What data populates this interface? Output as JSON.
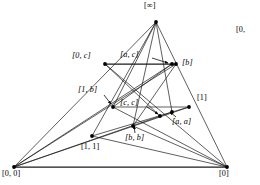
{
  "figure": {
    "type": "lattice-diagram",
    "background_color": "#ffffff",
    "line_color": "#1a1a1a",
    "vertex_color": "#000000",
    "nodes": [
      {
        "id": "infinity",
        "label": "[∞]",
        "x": 156,
        "y": 22,
        "label_x": 144,
        "label_y": 2,
        "leader": false
      },
      {
        "id": "zero_c",
        "label": "[0, c]",
        "x": 105,
        "y": 64,
        "label_x": 72,
        "label_y": 52,
        "leader": false
      },
      {
        "id": "a_c",
        "label": "[a, c]",
        "x": 172,
        "y": 64,
        "label_x": 120,
        "label_y": 51,
        "leader": true,
        "leader_x1": 152,
        "leader_y1": 58,
        "leader_x2": 168,
        "leader_y2": 63
      },
      {
        "id": "b",
        "label": "[b]",
        "x": 176,
        "y": 64,
        "label_x": 182,
        "label_y": 59,
        "leader": false
      },
      {
        "id": "one_b",
        "label": "[1, b]",
        "x": 113,
        "y": 107,
        "label_x": 78,
        "label_y": 86,
        "leader": true,
        "leader_x1": 104,
        "leader_y1": 95,
        "leader_x2": 111,
        "leader_y2": 104
      },
      {
        "id": "c_c",
        "label": "[c, c]",
        "x": 160,
        "y": 116,
        "label_x": 120,
        "label_y": 99,
        "leader": true,
        "leader_x1": 147,
        "leader_y1": 107,
        "leader_x2": 158,
        "leader_y2": 114
      },
      {
        "id": "one",
        "label": "[1]",
        "x": 189,
        "y": 107,
        "label_x": 197,
        "label_y": 94,
        "leader": false
      },
      {
        "id": "a_a",
        "label": "[a, a]",
        "x": 172,
        "y": 112,
        "label_x": 172,
        "label_y": 118,
        "leader": true,
        "leader_x1": 176,
        "leader_y1": 117,
        "leader_x2": 170,
        "leader_y2": 112
      },
      {
        "id": "b_b",
        "label": "[b, b]",
        "x": 133,
        "y": 126,
        "label_x": 125,
        "label_y": 134,
        "leader": true,
        "leader_x1": 135,
        "leader_y1": 133,
        "leader_x2": 134,
        "leader_y2": 126
      },
      {
        "id": "one_one",
        "label": "[1, 1]",
        "x": 92,
        "y": 136,
        "label_x": 81,
        "label_y": 143,
        "leader": false
      },
      {
        "id": "zero_zero",
        "label": "[0, 0]",
        "x": 14,
        "y": 167,
        "label_x": 2,
        "label_y": 170,
        "leader": false
      },
      {
        "id": "zero",
        "label": "[0]",
        "x": 227,
        "y": 167,
        "label_x": 219,
        "label_y": 170,
        "leader": false
      }
    ],
    "edges": [
      {
        "from": "zero_zero",
        "to": "infinity",
        "weight": "thin"
      },
      {
        "from": "zero_zero",
        "to": "zero",
        "weight": "thick"
      },
      {
        "from": "infinity",
        "to": "zero",
        "weight": "thin"
      },
      {
        "from": "zero_c",
        "to": "b",
        "weight": "thick"
      },
      {
        "from": "infinity",
        "to": "one_b",
        "weight": "thin"
      },
      {
        "from": "infinity",
        "to": "b_b",
        "weight": "thin"
      },
      {
        "from": "infinity",
        "to": "a_a",
        "weight": "thin"
      },
      {
        "from": "infinity",
        "to": "one_one",
        "weight": "thin"
      },
      {
        "from": "zero_zero",
        "to": "a_c",
        "weight": "thin"
      },
      {
        "from": "zero_zero",
        "to": "one",
        "weight": "thin"
      },
      {
        "from": "zero_zero",
        "to": "a_a",
        "weight": "thin"
      },
      {
        "from": "zero_zero",
        "to": "b",
        "weight": "thin"
      },
      {
        "from": "zero",
        "to": "zero_c",
        "weight": "thin"
      },
      {
        "from": "zero",
        "to": "one_b",
        "weight": "thin"
      },
      {
        "from": "zero",
        "to": "one_one",
        "weight": "thin"
      },
      {
        "from": "zero",
        "to": "b_b",
        "weight": "thin"
      },
      {
        "from": "zero_c",
        "to": "c_c",
        "weight": "thin"
      },
      {
        "from": "one_b",
        "to": "one",
        "weight": "thin"
      },
      {
        "from": "one_b",
        "to": "a_c",
        "weight": "thin"
      },
      {
        "from": "b",
        "to": "b_b",
        "weight": "thin"
      },
      {
        "from": "one",
        "to": "one_one",
        "weight": "thin"
      }
    ]
  },
  "edge_label": {
    "clipped_label": "[0,"
  }
}
